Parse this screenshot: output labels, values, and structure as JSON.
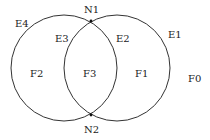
{
  "diagram": {
    "type": "planar-graph-two-circles",
    "stroke_color": "#333333",
    "background": "#ffffff",
    "nodes": [
      {
        "id": "N1",
        "label": "N1",
        "x": 91,
        "y": 21
      },
      {
        "id": "N2",
        "label": "N2",
        "x": 91,
        "y": 115
      }
    ],
    "edges": [
      {
        "id": "E1",
        "label": "E1"
      },
      {
        "id": "E2",
        "label": "E2"
      },
      {
        "id": "E3",
        "label": "E3"
      },
      {
        "id": "E4",
        "label": "E4"
      }
    ],
    "faces": [
      {
        "id": "F0",
        "label": "F0"
      },
      {
        "id": "F1",
        "label": "F1"
      },
      {
        "id": "F2",
        "label": "F2"
      },
      {
        "id": "F3",
        "label": "F3"
      }
    ]
  }
}
